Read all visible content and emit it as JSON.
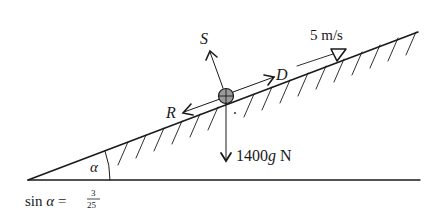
{
  "diagram": {
    "type": "inclined-plane free-body diagram",
    "forces": {
      "normal_reaction": {
        "label": "S"
      },
      "driving_force": {
        "label": "D"
      },
      "resistance": {
        "label": "R"
      },
      "weight": {
        "label_value": "1400",
        "label_g": "g",
        "label_unit": " N"
      }
    },
    "velocity": {
      "label": "5 m/s"
    },
    "angle": {
      "symbol": "α"
    },
    "formula": {
      "prefix": "sin ",
      "symbol": "α",
      "equals": " =",
      "numerator": "3",
      "denominator": "25"
    }
  }
}
